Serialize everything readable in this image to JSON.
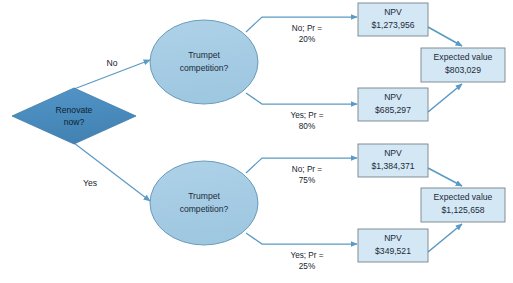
{
  "diagram": {
    "type": "decision-tree",
    "colors": {
      "decision_fill": "#4a8cbe",
      "decision_stroke": "#3d7aa8",
      "chance_fill": "#a6cde5",
      "chance_stroke": "#5e93b5",
      "outcome_fill": "#d4e7f4",
      "outcome_stroke": "#6f7b85",
      "arrow": "#5b9ac4",
      "text": "#16232e",
      "background": "#ffffff"
    },
    "decision_node": {
      "label_line1": "Renovate",
      "label_line2": "now?"
    },
    "branches": [
      {
        "id": "branch-no",
        "branch_label": "No",
        "chance_node": {
          "label_line1": "Trumpet",
          "label_line2": "competition?"
        },
        "outcomes": [
          {
            "id": "outcome-no-no",
            "edge_label_line1": "No; Pr =",
            "edge_label_line2": "20%",
            "probability": "20%",
            "box_line1": "NPV",
            "box_line2": "$1,273,956",
            "value": 1273956
          },
          {
            "id": "outcome-no-yes",
            "edge_label_line1": "Yes; Pr =",
            "edge_label_line2": "80%",
            "probability": "80%",
            "box_line1": "NPV",
            "box_line2": "$685,297",
            "value": 685297
          }
        ],
        "expected_value": {
          "id": "expected-value-no",
          "box_line1": "Expected value",
          "box_line2": "$803,029",
          "value": 803029
        }
      },
      {
        "id": "branch-yes",
        "branch_label": "Yes",
        "chance_node": {
          "label_line1": "Trumpet",
          "label_line2": "competition?"
        },
        "outcomes": [
          {
            "id": "outcome-yes-no",
            "edge_label_line1": "No; Pr =",
            "edge_label_line2": "75%",
            "probability": "75%",
            "box_line1": "NPV",
            "box_line2": "$1,384,371",
            "value": 1384371
          },
          {
            "id": "outcome-yes-yes",
            "edge_label_line1": "Yes; Pr =",
            "edge_label_line2": "25%",
            "probability": "25%",
            "box_line1": "NPV",
            "box_line2": "$349,521",
            "value": 349521
          }
        ],
        "expected_value": {
          "id": "expected-value-yes",
          "box_line1": "Expected value",
          "box_line2": "$1,125,658",
          "value": 1125658
        }
      }
    ]
  }
}
